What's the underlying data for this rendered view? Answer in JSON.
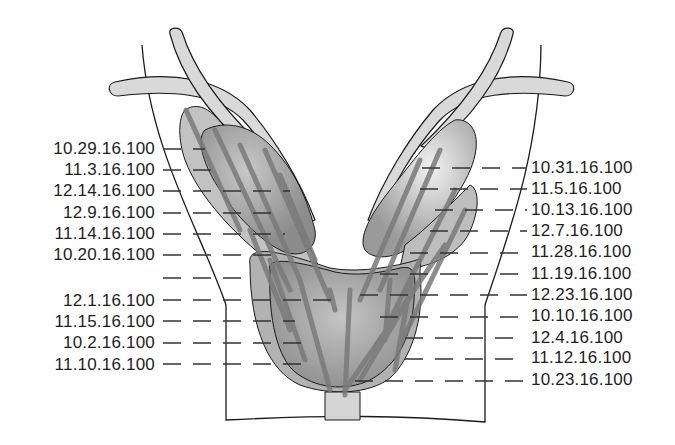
{
  "diagram": {
    "type": "prostate-biopsy-map",
    "colors": {
      "outline": "#1a1a1a",
      "tissue_light": "#d6d6d6",
      "tissue_mid": "#a8a8a8",
      "tissue_dark": "#8a8a8a",
      "core_tracks": "#7a7a7a",
      "leader_lines": "#333333"
    }
  },
  "labels_left": [
    {
      "text": "10.29.16.100",
      "y": 148
    },
    {
      "text": "11.3.16.100",
      "y": 169
    },
    {
      "text": "12.14.16.100",
      "y": 190
    },
    {
      "text": "12.9.16.100",
      "y": 212
    },
    {
      "text": "11.14.16.100",
      "y": 233
    },
    {
      "text": "10.20.16.100",
      "y": 254
    },
    {
      "text": "",
      "y": 277
    },
    {
      "text": "12.1.16.100",
      "y": 300
    },
    {
      "text": "11.15.16.100",
      "y": 321
    },
    {
      "text": "10.2.16.100",
      "y": 342
    },
    {
      "text": "11.10.16.100",
      "y": 364
    }
  ],
  "labels_right": [
    {
      "text": "10.31.16.100",
      "y": 168
    },
    {
      "text": "11.5.16.100",
      "y": 189
    },
    {
      "text": "10.13.16.100",
      "y": 210
    },
    {
      "text": "12.7.16.100",
      "y": 231
    },
    {
      "text": "11.28.16.100",
      "y": 252
    },
    {
      "text": "11.19.16.100",
      "y": 274
    },
    {
      "text": "12.23.16.100",
      "y": 295
    },
    {
      "text": "10.10.16.100",
      "y": 316
    },
    {
      "text": "12.4.16.100",
      "y": 338
    },
    {
      "text": "11.12.16.100",
      "y": 358
    },
    {
      "text": "10.23.16.100",
      "y": 380
    }
  ]
}
